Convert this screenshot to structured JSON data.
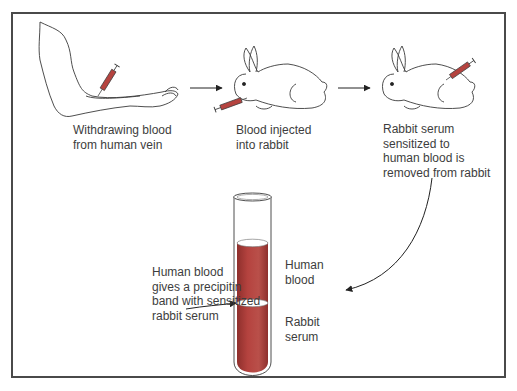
{
  "diagram": {
    "steps": [
      {
        "id": "step-1",
        "label": "Withdrawing blood\nfrom human vein",
        "icon": "arm-with-syringe"
      },
      {
        "id": "step-2",
        "label": "Blood injected\ninto rabbit",
        "icon": "rabbit-with-syringe-mouth"
      },
      {
        "id": "step-3",
        "label": "Rabbit serum\nsensitized to\nhuman blood is\nremoved from rabbit",
        "icon": "rabbit-with-syringe-back"
      }
    ],
    "tube": {
      "layers": [
        {
          "name": "upper",
          "label": "Human\nblood",
          "color": "#b5433f"
        },
        {
          "name": "lower",
          "label": "Rabbit\nserum",
          "color": "#b5433f"
        }
      ],
      "band_label": "Human blood\ngives a precipitin\nband with sensitized\nrabbit serum"
    },
    "colors": {
      "liquid": "#b5433f",
      "liquid_dark": "#8e2f2c",
      "line": "#3a3a3a",
      "border": "#4a4a4a"
    },
    "arrows": [
      {
        "from": "step-1",
        "to": "step-2"
      },
      {
        "from": "step-2",
        "to": "step-3"
      },
      {
        "from": "step-3",
        "to": "tube"
      },
      {
        "from": "band_label",
        "to": "tube-band"
      }
    ]
  }
}
